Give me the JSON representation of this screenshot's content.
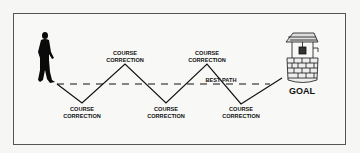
{
  "diagram": {
    "type": "course-correction-zigzag",
    "labels": {
      "best_path": "BEST PATH",
      "goal": "GOAL",
      "corrections": [
        {
          "line1": "COURSE",
          "line2": "CORRECTION",
          "position": "below",
          "order": 1
        },
        {
          "line1": "COURSE",
          "line2": "CORRECTION",
          "position": "above",
          "order": 2
        },
        {
          "line1": "COURSE",
          "line2": "CORRECTION",
          "position": "below",
          "order": 3
        },
        {
          "line1": "COURSE",
          "line2": "CORRECTION",
          "position": "above",
          "order": 4
        },
        {
          "line1": "COURSE",
          "line2": "CORRECTION",
          "position": "below",
          "order": 5
        }
      ]
    },
    "icons": {
      "start": "walking-person-icon",
      "end": "wishing-well-icon"
    },
    "colors": {
      "line": "#111111",
      "frame": "#555555",
      "background": "#f8f8f6"
    }
  }
}
